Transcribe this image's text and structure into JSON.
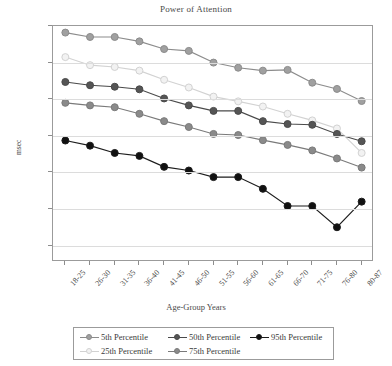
{
  "chart_data": {
    "type": "line",
    "title": "Power of Attention",
    "xlabel": "Age-Group Years",
    "ylabel": "msec",
    "categories": [
      "18-25",
      "26-30",
      "31-35",
      "36-40",
      "41-45",
      "46-50",
      "51-55",
      "56-60",
      "61-65",
      "66-70",
      "71-75",
      "76-80",
      "80-87"
    ],
    "yticks": [
      900,
      1000,
      1100,
      1200,
      1300,
      1400,
      1500
    ],
    "ylim": [
      900,
      1545
    ],
    "y_inverted": true,
    "grid": true,
    "legend_position": "bottom",
    "series": [
      {
        "name": "5th Percentile",
        "color": "#8c8c8c",
        "fill": "#a0a0a0",
        "values": [
          918,
          930,
          930,
          942,
          963,
          968,
          1000,
          1014,
          1022,
          1020,
          1055,
          1072,
          1105
        ]
      },
      {
        "name": "25th Percentile",
        "color": "#d2d2d2",
        "fill": "#f2f2f2",
        "values": [
          985,
          1007,
          1012,
          1022,
          1047,
          1068,
          1093,
          1106,
          1120,
          1140,
          1158,
          1180,
          1247
        ]
      },
      {
        "name": "50th Percentile",
        "color": "#4a4a4a",
        "fill": "#555555",
        "values": [
          1053,
          1062,
          1066,
          1073,
          1098,
          1117,
          1132,
          1132,
          1160,
          1168,
          1170,
          1195,
          1215
        ]
      },
      {
        "name": "75th Percentile",
        "color": "#7a7a7a",
        "fill": "#8a8a8a",
        "values": [
          1110,
          1117,
          1122,
          1140,
          1160,
          1176,
          1195,
          1198,
          1212,
          1225,
          1240,
          1262,
          1287
        ]
      },
      {
        "name": "95th Percentile",
        "color": "#1c1c1c",
        "fill": "#111111",
        "values": [
          1213,
          1227,
          1247,
          1255,
          1285,
          1295,
          1313,
          1313,
          1345,
          1392,
          1392,
          1450,
          1380
        ]
      }
    ]
  },
  "legend": {
    "items": [
      {
        "label": "5th Percentile",
        "row": 0,
        "col": 0
      },
      {
        "label": "25th Percentile",
        "row": 1,
        "col": 0
      },
      {
        "label": "50th Percentile",
        "row": 0,
        "col": 1
      },
      {
        "label": "75th Percentile",
        "row": 1,
        "col": 1
      },
      {
        "label": "95th Percentile",
        "row": 0,
        "col": 2
      }
    ]
  }
}
